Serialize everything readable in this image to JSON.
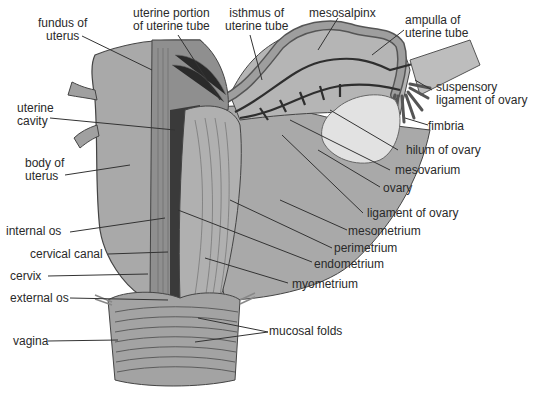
{
  "diagram": {
    "colors": {
      "background": "#ffffff",
      "tissue_fill": "#a9a9a9",
      "tissue_light": "#c4c4c4",
      "ovary_fill": "#e2e2e2",
      "vessel": "#2e2e2e",
      "leader_line": "#333333",
      "text": "#2a2a2a"
    },
    "labels": {
      "fundus": [
        "fundus of",
        "uterus"
      ],
      "uterine_portion": [
        "uterine portion",
        "of uterine tube"
      ],
      "isthmus": [
        "isthmus of",
        "uterine tube"
      ],
      "mesosalpinx": "mesosalpinx",
      "ampulla": [
        "ampulla of",
        "uterine tube"
      ],
      "suspensory": [
        "suspensory",
        "ligament of ovary"
      ],
      "fimbria": "fimbria",
      "hilum": "hilum of ovary",
      "mesovarium": "mesovarium",
      "ovary": "ovary",
      "ligament_ovary": "ligament of ovary",
      "mesometrium": "mesometrium",
      "perimetrium": "perimetrium",
      "endometrium": "endometrium",
      "myometrium": "myometrium",
      "mucosal_folds": "mucosal folds",
      "uterine_cavity": [
        "uterine",
        "cavity"
      ],
      "body": [
        "body of",
        "uterus"
      ],
      "internal_os": "internal os",
      "cervical_canal": "cervical canal",
      "cervix": "cervix",
      "external_os": "external os",
      "vagina": "vagina"
    }
  }
}
